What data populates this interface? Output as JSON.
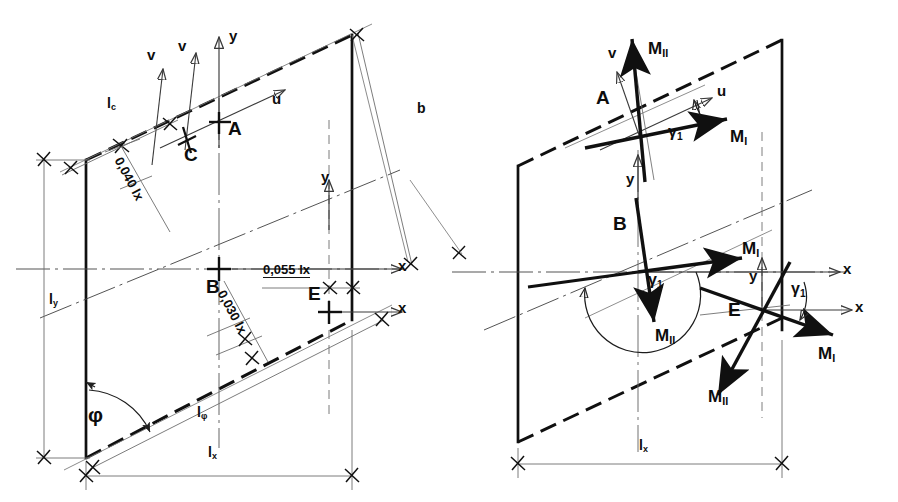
{
  "figure": {
    "ink_color": "#101010",
    "thin_color": "#6e6e6e"
  },
  "left_diagram": {
    "name": "geometry-and-axes",
    "points": [
      {
        "key": "A",
        "label": "A"
      },
      {
        "key": "C",
        "label": "C"
      },
      {
        "key": "B",
        "label": "B"
      },
      {
        "key": "E",
        "label": "E"
      }
    ],
    "axis_labels": {
      "v_outer": "v",
      "v_inner": "v",
      "y_top": "y",
      "u": "u",
      "x_mid": "x",
      "y_right": "y",
      "x_right": "x"
    },
    "dimensions": [
      {
        "key": "lc",
        "label": "l",
        "sub": "c"
      },
      {
        "key": "b",
        "label": "b",
        "sub": ""
      },
      {
        "key": "ly",
        "label": "l",
        "sub": "y"
      },
      {
        "key": "lphi",
        "label": "l",
        "sub": "φ"
      },
      {
        "key": "lx",
        "label": "l",
        "sub": "x"
      }
    ],
    "offsets": [
      {
        "key": "off_040",
        "label": "0,040 lx"
      },
      {
        "key": "off_055",
        "label": "0,055 lx"
      },
      {
        "key": "off_030",
        "label": "0,030 lx"
      }
    ],
    "angle": {
      "key": "phi",
      "label": "φ"
    }
  },
  "right_diagram": {
    "name": "principal-moment-directions",
    "points": [
      {
        "key": "A",
        "label": "A"
      },
      {
        "key": "B",
        "label": "B"
      },
      {
        "key": "E",
        "label": "E"
      }
    ],
    "axis_labels": {
      "v": "v",
      "u": "u",
      "y_A": "y",
      "x_B": "x",
      "y_E": "y",
      "x_E": "x"
    },
    "moments": [
      {
        "key": "A_MII",
        "label": "M",
        "sub": "II"
      },
      {
        "key": "A_MI",
        "label": "M",
        "sub": "I"
      },
      {
        "key": "B_MI",
        "label": "M",
        "sub": "I"
      },
      {
        "key": "B_MII",
        "label": "M",
        "sub": "II"
      },
      {
        "key": "E_MI",
        "label": "M",
        "sub": "I"
      },
      {
        "key": "E_MII",
        "label": "M",
        "sub": "II"
      }
    ],
    "angles": [
      {
        "key": "gamma_A",
        "label": "γ",
        "sub": "1"
      },
      {
        "key": "gamma_B",
        "label": "γ",
        "sub": "1"
      },
      {
        "key": "gamma_E",
        "label": "γ",
        "sub": "1"
      }
    ],
    "dimensions": [
      {
        "key": "lx",
        "label": "l",
        "sub": "x"
      }
    ]
  }
}
